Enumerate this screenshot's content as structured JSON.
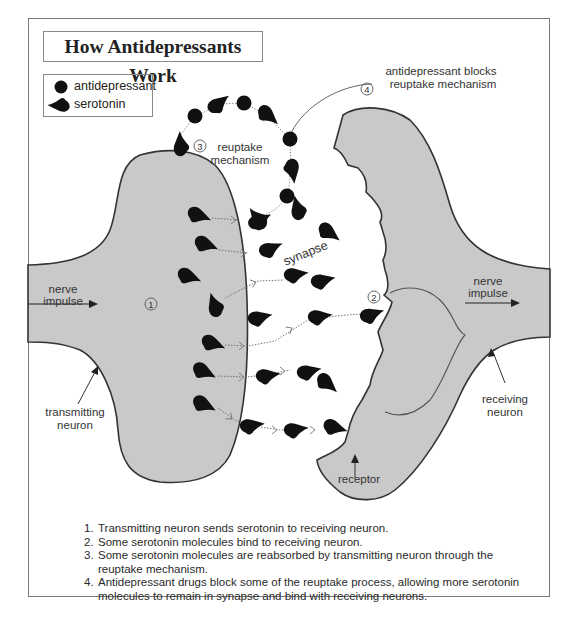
{
  "title": "How Antidepressants Work",
  "legend": {
    "items": [
      {
        "symbol": "antidepressant-circle",
        "label": "antidepressant"
      },
      {
        "symbol": "serotonin-shape",
        "label": "serotonin"
      }
    ]
  },
  "labels": {
    "nerve_impulse_left": [
      "nerve",
      "impulse"
    ],
    "nerve_impulse_right": [
      "nerve",
      "impulse"
    ],
    "transmitting_neuron": [
      "transmitting",
      "neuron"
    ],
    "receiving_neuron": [
      "receiving",
      "neuron"
    ],
    "receptor": "receptor",
    "synapse": "synapse",
    "reuptake_mechanism": [
      "reuptake",
      "mechanism"
    ],
    "antidepressant_blocks": [
      "antidepressant blocks",
      "reuptake mechanism"
    ]
  },
  "step_markers": [
    "1",
    "2",
    "3",
    "4"
  ],
  "notes": [
    {
      "num": "1.",
      "text": "Transmitting neuron sends serotonin to receiving neuron."
    },
    {
      "num": "2.",
      "text": "Some serotonin molecules bind to receiving neuron."
    },
    {
      "num": "3.",
      "text": "Some serotonin molecules are reabsorbed by transmitting neuron through the reuptake mechanism."
    },
    {
      "num": "4.",
      "text": "Antidepressant drugs block some of the reuptake process, allowing more serotonin molecules to remain in synapse and bind with receiving neurons."
    }
  ],
  "colors": {
    "neuron_fill": "#c9c9c9",
    "outline": "#333333",
    "molecule": "#111111",
    "frame": "#7a7a7a"
  }
}
